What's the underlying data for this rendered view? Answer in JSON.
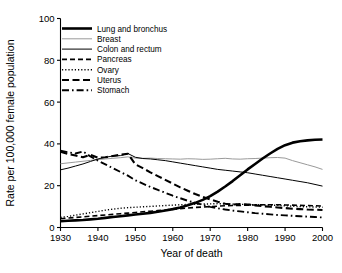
{
  "chart_data": {
    "type": "line",
    "title": "",
    "xlabel": "Year of death",
    "ylabel": "Rate per 100,000 female population",
    "xlim": [
      1930,
      2000
    ],
    "ylim": [
      0,
      100
    ],
    "xticks": [
      1930,
      1940,
      1950,
      1960,
      1970,
      1980,
      1990,
      2000
    ],
    "yticks": [
      0,
      20,
      40,
      60,
      80,
      100
    ],
    "grid": false,
    "legend_position": "top-left-inside",
    "x": [
      1930,
      1932,
      1934,
      1936,
      1938,
      1940,
      1942,
      1944,
      1946,
      1948,
      1950,
      1952,
      1954,
      1956,
      1958,
      1960,
      1962,
      1964,
      1966,
      1968,
      1970,
      1972,
      1974,
      1976,
      1978,
      1980,
      1982,
      1984,
      1986,
      1988,
      1990,
      1992,
      1994,
      1996,
      1998,
      2000
    ],
    "series": [
      {
        "name": "Lung and bronchus",
        "style": "solid",
        "width": 2.6,
        "color": "#000000",
        "values": [
          3.0,
          3.2,
          3.4,
          3.6,
          3.9,
          4.2,
          4.6,
          5.0,
          5.4,
          5.8,
          6.2,
          6.6,
          7.0,
          7.5,
          8.1,
          8.8,
          9.6,
          10.6,
          11.8,
          13.2,
          15.0,
          17.2,
          19.6,
          22.2,
          25.0,
          27.8,
          30.4,
          33.0,
          35.4,
          37.6,
          39.4,
          40.6,
          41.3,
          41.7,
          42.0,
          42.1
        ]
      },
      {
        "name": "Breast",
        "style": "solid",
        "width": 1.0,
        "color": "#9a9a9a",
        "values": [
          30.5,
          30.9,
          31.3,
          31.7,
          32.1,
          32.5,
          32.8,
          33.1,
          33.4,
          33.8,
          33.2,
          33.1,
          33.2,
          33.0,
          32.9,
          32.8,
          32.7,
          32.9,
          32.8,
          32.6,
          32.7,
          32.9,
          33.1,
          32.8,
          32.7,
          32.9,
          33.0,
          33.2,
          33.4,
          33.5,
          33.2,
          32.0,
          31.0,
          30.0,
          29.0,
          27.8
        ]
      },
      {
        "name": "Colon and rectum",
        "style": "solid",
        "width": 1.0,
        "color": "#000000",
        "values": [
          27.6,
          28.4,
          29.4,
          30.4,
          31.6,
          32.8,
          33.6,
          34.2,
          34.4,
          35.4,
          33.6,
          33.0,
          32.8,
          32.4,
          32.0,
          31.4,
          30.8,
          30.2,
          29.6,
          29.0,
          28.4,
          27.8,
          27.4,
          27.0,
          26.6,
          26.2,
          25.6,
          25.0,
          24.4,
          23.8,
          23.2,
          22.6,
          22.0,
          21.4,
          20.6,
          19.8
        ]
      },
      {
        "name": "Pancreas",
        "style": "dashed",
        "width": 1.6,
        "color": "#000000",
        "values": [
          4.2,
          4.5,
          4.8,
          5.1,
          5.4,
          5.7,
          6.0,
          6.3,
          6.6,
          6.9,
          7.2,
          7.5,
          7.8,
          8.1,
          8.4,
          8.7,
          9.0,
          9.3,
          9.6,
          9.8,
          10.0,
          10.2,
          10.4,
          10.5,
          10.6,
          10.7,
          10.8,
          10.9,
          10.9,
          10.9,
          10.8,
          10.7,
          10.6,
          10.5,
          10.4,
          10.3
        ]
      },
      {
        "name": "Ovary",
        "style": "dotted",
        "width": 1.4,
        "color": "#000000",
        "values": [
          4.8,
          5.3,
          5.9,
          6.5,
          7.1,
          7.7,
          8.3,
          8.8,
          9.2,
          9.5,
          9.7,
          9.9,
          10.1,
          10.3,
          10.5,
          10.7,
          10.9,
          11.0,
          11.1,
          11.2,
          11.3,
          11.4,
          11.3,
          11.2,
          11.1,
          11.0,
          10.9,
          10.8,
          10.7,
          10.6,
          10.4,
          10.2,
          10.0,
          9.9,
          9.8,
          9.7
        ]
      },
      {
        "name": "Uterus",
        "style": "longdash",
        "width": 2.1,
        "color": "#000000",
        "values": [
          36.2,
          35.2,
          34.4,
          33.6,
          34.8,
          33.4,
          33.6,
          34.2,
          34.8,
          35.3,
          30.2,
          28.4,
          26.4,
          24.6,
          22.8,
          21.0,
          19.2,
          17.6,
          16.0,
          14.6,
          13.4,
          12.3,
          11.4,
          11.0,
          11.2,
          11.0,
          10.6,
          10.2,
          9.9,
          9.6,
          9.3,
          9.0,
          8.8,
          8.6,
          8.5,
          8.4
        ]
      },
      {
        "name": "Stomach",
        "style": "dashdot",
        "width": 1.9,
        "color": "#000000",
        "values": [
          36.8,
          36.0,
          35.4,
          36.4,
          34.0,
          32.0,
          30.2,
          28.4,
          26.6,
          24.8,
          22.6,
          21.0,
          19.4,
          18.0,
          16.6,
          15.2,
          14.0,
          12.8,
          11.8,
          10.8,
          9.9,
          9.2,
          8.6,
          8.1,
          7.7,
          7.3,
          6.9,
          6.6,
          6.3,
          6.0,
          5.8,
          5.6,
          5.4,
          5.2,
          5.0,
          4.8
        ]
      }
    ]
  },
  "legend": {
    "entries": [
      {
        "label": "Lung and bronchus"
      },
      {
        "label": "Breast"
      },
      {
        "label": "Colon and rectum"
      },
      {
        "label": "Pancreas"
      },
      {
        "label": "Ovary"
      },
      {
        "label": "Uterus"
      },
      {
        "label": "Stomach"
      }
    ]
  },
  "axes": {
    "x_tick_labels": [
      "1930",
      "1940",
      "1950",
      "1960",
      "1970",
      "1980",
      "1990",
      "2000"
    ],
    "y_tick_labels": [
      "0",
      "20",
      "40",
      "60",
      "80",
      "100"
    ],
    "x_title": "Year of death",
    "y_title": "Rate per 100,000 female population"
  }
}
